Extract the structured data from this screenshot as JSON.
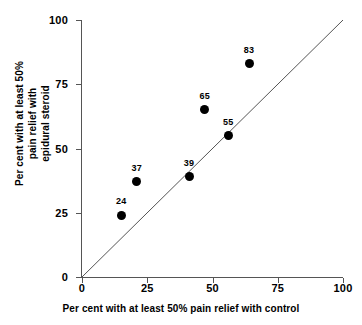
{
  "chart_data": {
    "type": "scatter",
    "title": "",
    "xlabel": "Per cent with at least 50% pain relief with control",
    "ylabel_lines": [
      "Per cent with at least 50%",
      "pain relief with",
      "epidural steroid"
    ],
    "ylabel": "Per cent with at least 50% pain relief with epidural steroid",
    "xlim": [
      0,
      100
    ],
    "ylim": [
      0,
      100
    ],
    "xticks": [
      "0",
      "25",
      "50",
      "75",
      "100"
    ],
    "yticks": [
      "0",
      "25",
      "50",
      "75",
      "100"
    ],
    "xtick_values": [
      0,
      25,
      50,
      75,
      100
    ],
    "ytick_values": [
      0,
      25,
      50,
      75,
      100
    ],
    "grid": false,
    "legend": "none",
    "marker": "filled-circle",
    "marker_color": "#000000",
    "reference_line": {
      "name": "line-of-equality",
      "type": "identity",
      "from": [
        0,
        0
      ],
      "to": [
        100,
        100
      ],
      "color": "#555555"
    },
    "points": [
      {
        "label": "24",
        "x": 15,
        "y": 24
      },
      {
        "label": "37",
        "x": 21,
        "y": 37
      },
      {
        "label": "39",
        "x": 41,
        "y": 39
      },
      {
        "label": "65",
        "x": 47,
        "y": 65
      },
      {
        "label": "55",
        "x": 56,
        "y": 55
      },
      {
        "label": "83",
        "x": 64,
        "y": 83
      }
    ]
  }
}
